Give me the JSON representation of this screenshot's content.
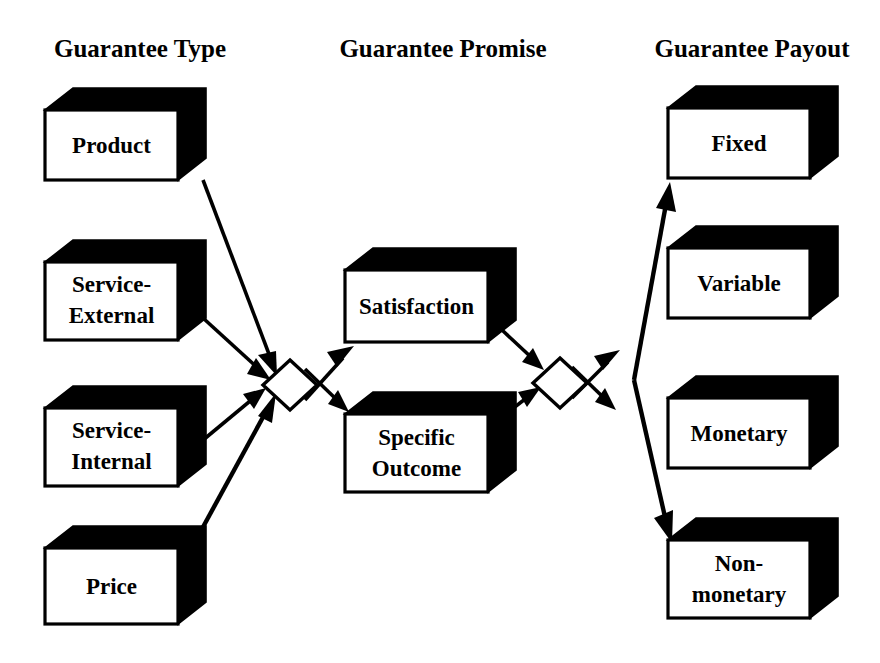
{
  "diagram": {
    "background_color": "#ffffff",
    "ink_color": "#000000",
    "columns": [
      {
        "id": "type",
        "header": "Guarantee Type",
        "header_x": 140,
        "header_y": 57
      },
      {
        "id": "promise",
        "header": "Guarantee Promise",
        "header_x": 443,
        "header_y": 57
      },
      {
        "id": "payout",
        "header": "Guarantee Payout",
        "header_x": 752,
        "header_y": 57
      }
    ],
    "boxes": [
      {
        "id": "product",
        "column": "type",
        "lines": [
          "Product"
        ],
        "x": 45,
        "y": 110,
        "w": 133,
        "h": 70,
        "dx": 28,
        "dy": 22
      },
      {
        "id": "service-external",
        "column": "type",
        "lines": [
          "Service-",
          "External"
        ],
        "x": 45,
        "y": 262,
        "w": 133,
        "h": 78,
        "dx": 28,
        "dy": 22
      },
      {
        "id": "service-internal",
        "column": "type",
        "lines": [
          "Service-",
          "Internal"
        ],
        "x": 45,
        "y": 408,
        "w": 133,
        "h": 78,
        "dx": 28,
        "dy": 22
      },
      {
        "id": "price",
        "column": "type",
        "lines": [
          "Price"
        ],
        "x": 45,
        "y": 548,
        "w": 133,
        "h": 76,
        "dx": 28,
        "dy": 22
      },
      {
        "id": "satisfaction",
        "column": "promise",
        "lines": [
          "Satisfaction"
        ],
        "x": 345,
        "y": 270,
        "w": 143,
        "h": 72,
        "dx": 28,
        "dy": 22
      },
      {
        "id": "specific-outcome",
        "column": "promise",
        "lines": [
          "Specific",
          "Outcome"
        ],
        "x": 345,
        "y": 414,
        "w": 143,
        "h": 78,
        "dx": 28,
        "dy": 22
      },
      {
        "id": "fixed",
        "column": "payout",
        "lines": [
          "Fixed"
        ],
        "x": 668,
        "y": 108,
        "w": 142,
        "h": 70,
        "dx": 28,
        "dy": 22
      },
      {
        "id": "variable",
        "column": "payout",
        "lines": [
          "Variable"
        ],
        "x": 668,
        "y": 248,
        "w": 142,
        "h": 70,
        "dx": 28,
        "dy": 22
      },
      {
        "id": "monetary",
        "column": "payout",
        "lines": [
          "Monetary"
        ],
        "x": 668,
        "y": 398,
        "w": 142,
        "h": 70,
        "dx": 28,
        "dy": 22
      },
      {
        "id": "non-monetary",
        "column": "payout",
        "lines": [
          "Non-",
          "monetary"
        ],
        "x": 668,
        "y": 540,
        "w": 142,
        "h": 78,
        "dx": 28,
        "dy": 22
      }
    ],
    "diamonds": [
      {
        "id": "diamond-type-promise",
        "cx": 290,
        "cy": 385,
        "rx": 27,
        "ry": 25
      },
      {
        "id": "diamond-promise-payout",
        "cx": 560,
        "cy": 383,
        "rx": 27,
        "ry": 25
      }
    ],
    "connections": [
      {
        "id": "product-to-diamond1",
        "from": "product",
        "to": "diamond-type-promise",
        "kind": "arrow"
      },
      {
        "id": "service-external-to-diamond1",
        "from": "service-external",
        "to": "diamond-type-promise",
        "kind": "arrow"
      },
      {
        "id": "service-internal-to-diamond1",
        "from": "service-internal",
        "to": "diamond-type-promise",
        "kind": "arrow"
      },
      {
        "id": "price-to-diamond1",
        "from": "price",
        "to": "diamond-type-promise",
        "kind": "arrow"
      },
      {
        "id": "diamond1-to-satisfaction",
        "from": "diamond-type-promise",
        "to": "satisfaction",
        "kind": "arrow"
      },
      {
        "id": "diamond1-to-specific-outcome",
        "from": "diamond-type-promise",
        "to": "specific-outcome",
        "kind": "arrow"
      },
      {
        "id": "satisfaction-to-diamond2",
        "from": "satisfaction",
        "to": "diamond-promise-payout",
        "kind": "arrow"
      },
      {
        "id": "specific-outcome-to-diamond2",
        "from": "specific-outcome",
        "to": "diamond-promise-payout",
        "kind": "arrow"
      },
      {
        "id": "diamond2-to-fixed",
        "from": "diamond-promise-payout",
        "to": "fixed",
        "kind": "arrow"
      },
      {
        "id": "diamond2-to-non-monetary",
        "from": "diamond-promise-payout",
        "to": "non-monetary",
        "kind": "arrow"
      }
    ]
  }
}
